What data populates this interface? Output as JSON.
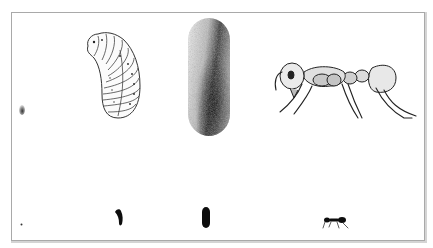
{
  "figure": {
    "frame_color": "#a9a9a9",
    "background": "#ffffff",
    "ink_color": "#111111",
    "enlarged_row": [
      {
        "stage": "egg",
        "icon": "egg-icon"
      },
      {
        "stage": "larva",
        "icon": "larva-icon"
      },
      {
        "stage": "pupa-cocoon",
        "icon": "cocoon-icon"
      },
      {
        "stage": "adult-worker",
        "icon": "ant-icon"
      }
    ],
    "actual_size_row": [
      {
        "stage": "egg",
        "icon": "egg-dot-icon"
      },
      {
        "stage": "larva",
        "icon": "larva-silhouette-icon"
      },
      {
        "stage": "pupa-cocoon",
        "icon": "cocoon-silhouette-icon"
      },
      {
        "stage": "adult-worker",
        "icon": "ant-silhouette-icon"
      }
    ]
  }
}
